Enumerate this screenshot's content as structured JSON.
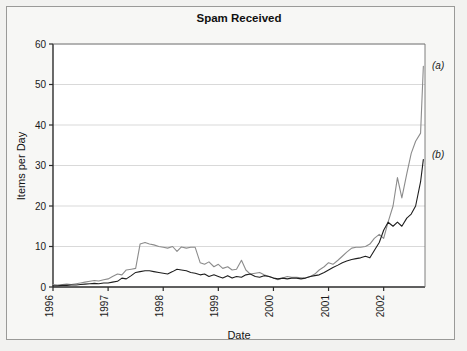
{
  "chart_data": {
    "type": "line",
    "title": "Spam Received",
    "xlabel": "Date",
    "ylabel": "Items per Day",
    "xlim": [
      1996.0,
      2002.75
    ],
    "ylim": [
      0,
      60
    ],
    "yticks": [
      0,
      10,
      20,
      30,
      40,
      50,
      60
    ],
    "xticks": [
      1996,
      1997,
      1998,
      1999,
      2000,
      2001,
      2002
    ],
    "xtick_labels": [
      "1996",
      "1997",
      "1998",
      "1999",
      "2000",
      "2001",
      "2002"
    ],
    "ytick_labels": [
      "0",
      "10",
      "20",
      "30",
      "40",
      "50",
      "60"
    ],
    "grid": "horizontal",
    "legend_position": "right-inline-annotations",
    "annotations": [
      {
        "text": "(a)",
        "series": "a",
        "x": 2002.78,
        "y": 53.0
      },
      {
        "text": "(b)",
        "series": "b",
        "x": 2002.78,
        "y": 32.5
      }
    ],
    "colors": {
      "series_a": "#8c8c8c",
      "series_b": "#1f1f1f",
      "axis": "#2b2b2b",
      "grid": "#cfcfcf",
      "background": "#ffffff",
      "frame": "#9a9a98",
      "page": "#f2f2f0"
    },
    "series": [
      {
        "name": "(a)",
        "label": "(a)",
        "color": "#8c8c8c",
        "x": [
          1996.0,
          1996.08,
          1996.17,
          1996.25,
          1996.33,
          1996.42,
          1996.5,
          1996.58,
          1996.67,
          1996.75,
          1996.83,
          1996.92,
          1997.0,
          1997.08,
          1997.17,
          1997.25,
          1997.33,
          1997.42,
          1997.5,
          1997.58,
          1997.67,
          1997.75,
          1997.83,
          1997.92,
          1998.0,
          1998.08,
          1998.17,
          1998.25,
          1998.33,
          1998.42,
          1998.5,
          1998.58,
          1998.67,
          1998.75,
          1998.83,
          1998.92,
          1999.0,
          1999.08,
          1999.17,
          1999.25,
          1999.33,
          1999.42,
          1999.5,
          1999.58,
          1999.67,
          1999.75,
          1999.83,
          1999.92,
          2000.0,
          2000.08,
          2000.17,
          2000.25,
          2000.33,
          2000.42,
          2000.5,
          2000.58,
          2000.67,
          2000.75,
          2000.83,
          2000.92,
          2001.0,
          2001.08,
          2001.17,
          2001.25,
          2001.33,
          2001.42,
          2001.5,
          2001.58,
          2001.67,
          2001.75,
          2001.83,
          2001.92,
          2002.0,
          2002.08,
          2002.17,
          2002.25,
          2002.33,
          2002.42,
          2002.5,
          2002.58,
          2002.67,
          2002.72
        ],
        "y": [
          0.6,
          0.5,
          0.6,
          0.7,
          0.6,
          0.8,
          1.0,
          1.2,
          1.4,
          1.6,
          1.5,
          1.8,
          2.0,
          2.6,
          3.2,
          3.0,
          4.2,
          4.4,
          4.6,
          10.6,
          11.0,
          10.6,
          10.4,
          10.0,
          9.8,
          9.6,
          10.0,
          8.8,
          9.9,
          9.6,
          9.8,
          9.8,
          6.0,
          5.6,
          6.2,
          5.0,
          5.6,
          4.6,
          5.0,
          4.2,
          4.4,
          6.6,
          4.2,
          3.2,
          3.4,
          3.6,
          3.0,
          2.6,
          2.2,
          1.8,
          2.2,
          2.6,
          2.4,
          2.4,
          2.3,
          2.2,
          2.6,
          3.2,
          4.2,
          5.0,
          6.0,
          5.6,
          6.6,
          7.6,
          8.6,
          9.6,
          9.8,
          9.8,
          10.0,
          10.6,
          12.0,
          13.0,
          12.0,
          16.0,
          20.0,
          27.0,
          22.0,
          28.0,
          33.0,
          36.0,
          38.0,
          54.5
        ]
      },
      {
        "name": "(b)",
        "label": "(b)",
        "color": "#1f1f1f",
        "x": [
          1996.0,
          1996.08,
          1996.17,
          1996.25,
          1996.33,
          1996.42,
          1996.5,
          1996.58,
          1996.67,
          1996.75,
          1996.83,
          1996.92,
          1997.0,
          1997.08,
          1997.17,
          1997.25,
          1997.33,
          1997.42,
          1997.5,
          1997.58,
          1997.67,
          1997.75,
          1997.83,
          1997.92,
          1998.0,
          1998.08,
          1998.17,
          1998.25,
          1998.33,
          1998.42,
          1998.5,
          1998.58,
          1998.67,
          1998.75,
          1998.83,
          1998.92,
          1999.0,
          1999.08,
          1999.17,
          1999.25,
          1999.33,
          1999.42,
          1999.5,
          1999.58,
          1999.67,
          1999.75,
          1999.83,
          1999.92,
          2000.0,
          2000.08,
          2000.17,
          2000.25,
          2000.33,
          2000.42,
          2000.5,
          2000.58,
          2000.67,
          2000.75,
          2000.83,
          2000.92,
          2001.0,
          2001.08,
          2001.17,
          2001.25,
          2001.33,
          2001.42,
          2001.5,
          2001.58,
          2001.67,
          2001.75,
          2001.83,
          2001.92,
          2002.0,
          2002.08,
          2002.17,
          2002.25,
          2002.33,
          2002.42,
          2002.5,
          2002.58,
          2002.67,
          2002.72
        ],
        "y": [
          0.3,
          0.3,
          0.4,
          0.4,
          0.5,
          0.5,
          0.6,
          0.7,
          0.8,
          0.9,
          0.8,
          1.0,
          1.0,
          1.2,
          1.4,
          2.2,
          2.0,
          2.8,
          3.6,
          3.8,
          4.0,
          4.0,
          3.8,
          3.6,
          3.4,
          3.2,
          3.8,
          4.4,
          4.2,
          4.0,
          3.6,
          3.4,
          3.0,
          3.2,
          2.6,
          3.0,
          2.6,
          2.2,
          2.8,
          2.2,
          2.6,
          2.4,
          3.0,
          3.2,
          2.6,
          2.4,
          2.8,
          2.6,
          2.2,
          2.0,
          2.2,
          2.0,
          2.2,
          2.2,
          2.0,
          2.2,
          2.6,
          2.8,
          3.0,
          3.6,
          4.2,
          4.8,
          5.4,
          6.0,
          6.4,
          6.8,
          7.0,
          7.2,
          7.6,
          7.2,
          9.0,
          11.0,
          14.0,
          16.0,
          15.0,
          16.0,
          15.0,
          17.0,
          18.0,
          20.0,
          26.0,
          31.5
        ]
      }
    ]
  },
  "figure": {
    "title": "Spam Received",
    "xlabel": "Date",
    "ylabel": "Items per Day",
    "annotation_a": "(a)",
    "annotation_b": "(b)",
    "ytick_0": "0",
    "ytick_10": "10",
    "ytick_20": "20",
    "ytick_30": "30",
    "ytick_40": "40",
    "ytick_50": "50",
    "ytick_60": "60",
    "xtick_1996": "1996",
    "xtick_1997": "1997",
    "xtick_1998": "1998",
    "xtick_1999": "1999",
    "xtick_2000": "2000",
    "xtick_2001": "2001",
    "xtick_2002": "2002"
  }
}
